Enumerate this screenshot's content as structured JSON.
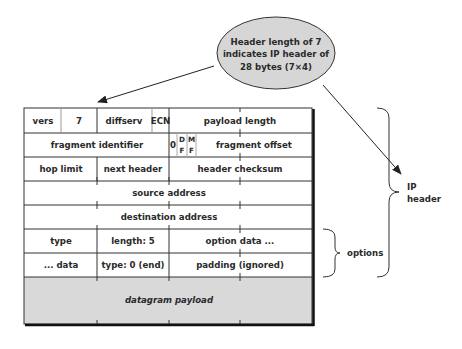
{
  "callout": {
    "lines": [
      "Header length of 7",
      "indicates IP header of",
      "28 bytes (7×4)"
    ],
    "fill": "#d6d6d6"
  },
  "table": {
    "row1": {
      "vers": "vers",
      "hlen": "7",
      "diffserv": "diffserv",
      "ecn": "ECN",
      "payload_length": "payload length"
    },
    "row2": {
      "fragment_identifier": "fragment identifier",
      "zero": "0",
      "df_top": "D",
      "df_bottom": "F",
      "mf_top": "M",
      "mf_bottom": "F",
      "fragment_offset": "fragment offset"
    },
    "row3": {
      "hop_limit": "hop limit",
      "next_header": "next header",
      "header_checksum": "header checksum"
    },
    "row4": {
      "source_address": "source address"
    },
    "row5": {
      "destination_address": "destination address"
    },
    "row6": {
      "type": "type",
      "length": "length: 5",
      "option_data": "option data ..."
    },
    "row7": {
      "data": "... data",
      "type_end": "type: 0 (end)",
      "padding": "padding (ignored)"
    },
    "payload": {
      "label": "datagram payload",
      "fill": "#d9d9d9"
    }
  },
  "braces": {
    "options_label": "options",
    "ip_header_label_line1": "IP",
    "ip_header_label_line2": "header"
  }
}
